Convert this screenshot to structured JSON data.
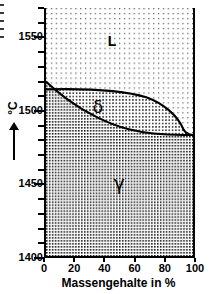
{
  "figure": {
    "kind": "binary-phase-diagram",
    "edge_fragments": [
      {
        "top": 4
      },
      {
        "top": 12
      },
      {
        "top": 20
      },
      {
        "top": 28
      },
      {
        "top": 36
      }
    ]
  },
  "y_axis": {
    "label": "°C",
    "arrow": "up-arrow",
    "min": 1400,
    "max": 1570,
    "tick_labels": [
      "1550",
      "1500",
      "1450",
      "1400"
    ],
    "tick_values": [
      1550,
      1500,
      1450,
      1400
    ],
    "minor_step": 10
  },
  "x_axis": {
    "title": "Massengehalte in %",
    "min": 0,
    "max": 100,
    "tick_labels": [
      "0",
      "20",
      "40",
      "60",
      "80",
      "100"
    ],
    "tick_values": [
      0,
      20,
      40,
      60,
      80,
      100
    ]
  },
  "phases": [
    {
      "id": "liquid",
      "label": "L",
      "x_pct": 44,
      "temp": 1545,
      "texture": "sparse-dots"
    },
    {
      "id": "delta",
      "label": "δ",
      "x_pct": 33,
      "temp": 1503,
      "texture": "medium-dots"
    },
    {
      "id": "gamma",
      "label": "γ",
      "x_pct": 46,
      "temp": 1448,
      "texture": "dense-checker"
    }
  ],
  "colors": {
    "ink": "#000000",
    "background": "#ffffff",
    "texture_dot": "#555555",
    "texture_dot_dark": "#222222"
  },
  "chart_data": {
    "type": "line",
    "title": "",
    "xlabel": "Massengehalte in %",
    "ylabel": "°C",
    "xlim": [
      0,
      100
    ],
    "ylim": [
      1400,
      1570
    ],
    "grid": false,
    "legend": "none",
    "annotations": [
      {
        "text": "L",
        "x": 44,
        "y": 1545
      },
      {
        "text": "δ",
        "x": 33,
        "y": 1503
      },
      {
        "text": "γ",
        "x": 46,
        "y": 1448
      }
    ],
    "series": [
      {
        "name": "liquidus (L / δ boundary)",
        "x": [
          0,
          10,
          20,
          30,
          40,
          50,
          60,
          70,
          80,
          88,
          93,
          96,
          97
        ],
        "values": [
          1533,
          1532,
          1530,
          1528,
          1525,
          1521,
          1516,
          1510,
          1501,
          1494,
          1489,
          1487,
          1494
        ]
      },
      {
        "name": "solidus (δ / γ boundary)",
        "x": [
          0,
          10,
          20,
          30,
          40,
          50,
          60,
          70,
          80,
          90,
          97
        ],
        "values": [
          1469,
          1473,
          1477,
          1480,
          1484,
          1487,
          1489,
          1491,
          1493,
          1494,
          1494
        ]
      }
    ]
  }
}
